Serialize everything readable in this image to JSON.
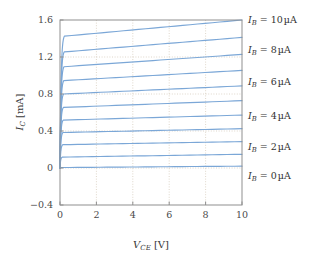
{
  "chart_data": {
    "type": "line",
    "title": "",
    "xlabel": "V_CE [V]",
    "ylabel": "I_C [mA]",
    "xlabel_parts": {
      "symbol": "V",
      "subscript": "CE",
      "unit": "[V]"
    },
    "ylabel_parts": {
      "symbol": "I",
      "subscript": "C",
      "unit": "[mA]"
    },
    "xlim": [
      0,
      10
    ],
    "ylim": [
      -0.4,
      1.6
    ],
    "xticks": [
      0,
      2,
      4,
      6,
      8,
      10
    ],
    "yticks": [
      -0.4,
      0,
      0.4,
      0.8,
      1.2,
      1.6
    ],
    "xticklabels": [
      "0",
      "2",
      "4",
      "6",
      "8",
      "10"
    ],
    "yticklabels": [
      "-0.4",
      "0",
      "0.4",
      "0.8",
      "1.2",
      "1.6"
    ],
    "grid": true,
    "grid_style": "dotted",
    "legend_position": "right-outside",
    "series_color": "#7ba7d7",
    "axis_color": "#8f8f8f",
    "grid_color": "#c9bca8",
    "series": [
      {
        "name": "I_B = 0 uA",
        "ib_ua": 0,
        "knee_v": 0.12,
        "ic_knee": 0.005,
        "ic_at_10v": 0.02,
        "labeled": true,
        "label_y_frac": 0.0125
      },
      {
        "name": "I_B = 1 uA",
        "ib_ua": 1,
        "knee_v": 0.14,
        "ic_knee": 0.118,
        "ic_at_10v": 0.148,
        "labeled": false,
        "label_y_frac": 0
      },
      {
        "name": "I_B = 2 uA",
        "ib_ua": 2,
        "knee_v": 0.16,
        "ic_knee": 0.252,
        "ic_at_10v": 0.285,
        "labeled": true,
        "label_y_frac": 0.2685
      },
      {
        "name": "I_B = 3 uA",
        "ib_ua": 3,
        "knee_v": 0.17,
        "ic_knee": 0.384,
        "ic_at_10v": 0.425,
        "labeled": false,
        "label_y_frac": 0
      },
      {
        "name": "I_B = 4 uA",
        "ib_ua": 4,
        "knee_v": 0.18,
        "ic_knee": 0.518,
        "ic_at_10v": 0.572,
        "labeled": true,
        "label_y_frac": 0.545
      },
      {
        "name": "I_B = 5 uA",
        "ib_ua": 5,
        "knee_v": 0.19,
        "ic_knee": 0.655,
        "ic_at_10v": 0.728,
        "labeled": false,
        "label_y_frac": 0
      },
      {
        "name": "I_B = 6 uA",
        "ib_ua": 6,
        "knee_v": 0.2,
        "ic_knee": 0.8,
        "ic_at_10v": 0.888,
        "labeled": true,
        "label_y_frac": 0.844
      },
      {
        "name": "I_B = 7 uA",
        "ib_ua": 7,
        "knee_v": 0.21,
        "ic_knee": 0.945,
        "ic_at_10v": 1.055,
        "labeled": false,
        "label_y_frac": 0
      },
      {
        "name": "I_B = 8 uA",
        "ib_ua": 8,
        "knee_v": 0.22,
        "ic_knee": 1.095,
        "ic_at_10v": 1.228,
        "labeled": true,
        "label_y_frac": 1.1615
      },
      {
        "name": "I_B = 9 uA",
        "ib_ua": 9,
        "knee_v": 0.23,
        "ic_knee": 1.255,
        "ic_at_10v": 1.412,
        "labeled": false,
        "label_y_frac": 0
      },
      {
        "name": "I_B = 10 uA",
        "ib_ua": 10,
        "knee_v": 0.24,
        "ic_knee": 1.425,
        "ic_at_10v": 1.6,
        "labeled": true,
        "label_y_frac": 1.5125
      }
    ],
    "legend_entries": [
      {
        "symbol": "I",
        "subscript": "B",
        "equals": "=",
        "value": "10",
        "unit": "µA",
        "text": "I_B = 10 µA",
        "y_px": 20
      },
      {
        "symbol": "I",
        "subscript": "B",
        "equals": "=",
        "value": "8",
        "unit": "µA",
        "text": "I_B = 8 µA",
        "y_px": 50
      },
      {
        "symbol": "I",
        "subscript": "B",
        "equals": "=",
        "value": "6",
        "unit": "µA",
        "text": "I_B = 6 µA",
        "y_px": 82
      },
      {
        "symbol": "I",
        "subscript": "B",
        "equals": "=",
        "value": "4",
        "unit": "µA",
        "text": "I_B = 4 µA",
        "y_px": 116
      },
      {
        "symbol": "I",
        "subscript": "B",
        "equals": "=",
        "value": "2",
        "unit": "µA",
        "text": "I_B = 2 µA",
        "y_px": 147
      },
      {
        "symbol": "I",
        "subscript": "B",
        "equals": "=",
        "value": "0",
        "unit": "µA",
        "text": "I_B = 0 µA",
        "y_px": 176
      }
    ]
  },
  "layout": {
    "plot_left": 60,
    "plot_right": 242,
    "plot_top": 20,
    "plot_bottom": 205
  }
}
